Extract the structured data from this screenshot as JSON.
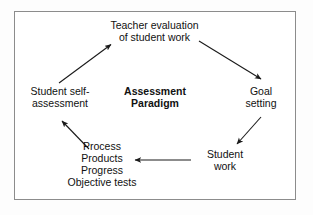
{
  "diagram": {
    "frame": {
      "border_color": "#8c8c8c",
      "background_color": "#ffffff"
    },
    "center": {
      "name": "assessment-paradigm",
      "line1": "Assessment",
      "line2": "Paradigm"
    },
    "nodes": [
      {
        "name": "teacher-evaluation",
        "line1": "Teacher evaluation",
        "line2": "of student work"
      },
      {
        "name": "goal-setting",
        "line1": "Goal",
        "line2": "setting"
      },
      {
        "name": "student-work",
        "line1": "Student",
        "line2": "work"
      },
      {
        "name": "evidence-list",
        "line1": "Process",
        "line2": "Products",
        "line3": "Progress",
        "line4": "Objective tests"
      },
      {
        "name": "student-self-assessment",
        "line1": "Student self-",
        "line2": "assessment"
      }
    ],
    "arrows": [
      {
        "name": "arrow-teacher-evaluation-to-goal-setting",
        "from": "teacher-evaluation",
        "to": "goal-setting"
      },
      {
        "name": "arrow-goal-setting-to-student-work",
        "from": "goal-setting",
        "to": "student-work"
      },
      {
        "name": "arrow-student-work-to-evidence-list",
        "from": "student-work",
        "to": "evidence-list"
      },
      {
        "name": "arrow-evidence-list-to-student-self-assessment",
        "from": "evidence-list",
        "to": "student-self-assessment"
      },
      {
        "name": "arrow-student-self-assessment-to-teacher-evaluation",
        "from": "student-self-assessment",
        "to": "teacher-evaluation"
      }
    ],
    "line_color": "#1a1a1a"
  }
}
